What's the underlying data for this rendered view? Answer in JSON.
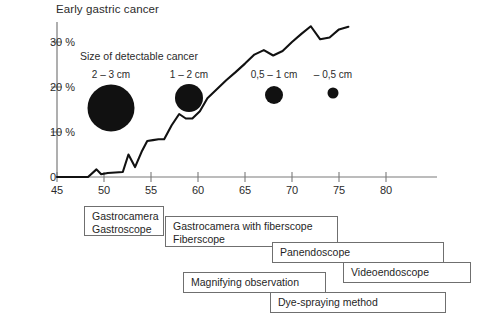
{
  "chart_data": {
    "type": "line",
    "title": "Early gastric cancer",
    "xlabel": "",
    "ylabel": "",
    "xlim": [
      45,
      85
    ],
    "ylim": [
      0,
      33
    ],
    "grid": false,
    "legend_position": "none",
    "xtick_labels": [
      "45",
      "50",
      "55",
      "60",
      "65",
      "70",
      "75",
      "80"
    ],
    "xtick_values": [
      45,
      50,
      55,
      60,
      65,
      70,
      75,
      80
    ],
    "ytick_labels": [
      "0",
      "10 %",
      "20 %",
      "30 %"
    ],
    "ytick_values": [
      0,
      10,
      20,
      30
    ],
    "series": [
      {
        "name": "Proportion of early gastric cancer",
        "x": [
          45.0,
          48.3,
          49.2,
          49.7,
          50.4,
          51.2,
          52.0,
          52.6,
          53.3,
          54.0,
          54.6,
          55.2,
          55.8,
          56.4,
          57.2,
          58.0,
          58.7,
          59.4,
          60.2,
          61.0,
          62.0,
          63.0,
          64.0,
          65.0,
          66.0,
          67.0,
          68.0,
          69.0,
          70.0,
          71.0,
          72.0,
          73.0,
          74.0,
          75.0,
          76.0
        ],
        "y": [
          0.0,
          0.0,
          1.7,
          0.6,
          0.9,
          1.0,
          1.1,
          5.0,
          2.2,
          5.6,
          8.0,
          8.2,
          8.4,
          8.4,
          11.5,
          14.0,
          13.0,
          13.0,
          14.6,
          17.5,
          19.5,
          21.5,
          23.3,
          25.2,
          27.2,
          28.2,
          27.0,
          28.0,
          30.0,
          31.8,
          33.5,
          30.6,
          31.0,
          32.8,
          33.4
        ]
      }
    ]
  },
  "legend": {
    "title": "Size of detectable cancer",
    "bubbles": [
      {
        "label": "2 – 3 cm",
        "diameter_px": 47
      },
      {
        "label": "1 – 2 cm",
        "diameter_px": 28
      },
      {
        "label": "0,5 – 1 cm",
        "diameter_px": 18
      },
      {
        "label": "– 0,5 cm",
        "diameter_px": 11
      }
    ]
  },
  "timeline": {
    "boxes": [
      {
        "text": "Gastrocamera\nGastroscope"
      },
      {
        "text": "Gastrocamera with fiberscope\nFiberscope"
      },
      {
        "text": "Panendoscope"
      },
      {
        "text": "Videoendoscope"
      },
      {
        "text": "Magnifying observation"
      },
      {
        "text": "Dye-spraying method"
      }
    ]
  },
  "colors": {
    "line": "#111111",
    "axis": "#7a7a7a",
    "bubble": "#111111",
    "box_border": "#6f6f6f",
    "text": "#1f1f1f"
  }
}
